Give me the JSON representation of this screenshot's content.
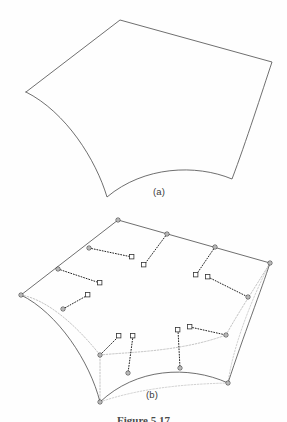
{
  "figure": {
    "panels": [
      {
        "id": "a",
        "label": "(a)"
      },
      {
        "id": "b",
        "label": "(b)"
      }
    ],
    "caption": "Figure 5.17",
    "colors": {
      "background": "#fefefe",
      "outline": "#555555",
      "control_polygon": "#9a9a9a",
      "marker_stroke": "#333333",
      "dotted_connector": "#222222",
      "label_text": "#3a3a3a"
    }
  },
  "panel_a": {
    "description": "Smooth curved quadrilateral surface patch outline",
    "corners": [
      {
        "name": "top",
        "x": 120,
        "y": 20
      },
      {
        "name": "right",
        "x": 272,
        "y": 62
      },
      {
        "name": "bottom-right",
        "x": 232,
        "y": 179
      },
      {
        "name": "bottom-left",
        "x": 107,
        "y": 197
      },
      {
        "name": "left",
        "x": 26,
        "y": 92
      }
    ],
    "edges": [
      {
        "from": "left",
        "to": "top",
        "curvature": "straight"
      },
      {
        "from": "top",
        "to": "right",
        "curvature": "straight"
      },
      {
        "from": "right",
        "to": "bottom-right",
        "curvature": "concave"
      },
      {
        "from": "bottom-right",
        "to": "bottom-left",
        "curvature": "concave"
      },
      {
        "from": "bottom-left",
        "to": "left",
        "curvature": "concave"
      }
    ]
  },
  "panel_b": {
    "description": "Same patch with boundary control points (circles), offset vectors (dotted) and square cross-boundary control points",
    "corners": [
      {
        "name": "top",
        "x": 118,
        "y": 220
      },
      {
        "name": "right",
        "x": 270,
        "y": 263
      },
      {
        "name": "bottom-right",
        "x": 228,
        "y": 383
      },
      {
        "name": "bottom-left",
        "x": 100,
        "y": 402
      },
      {
        "name": "left",
        "x": 21,
        "y": 295
      }
    ],
    "boundary_nodes": [
      {
        "x": 118,
        "y": 220
      },
      {
        "x": 89,
        "y": 248
      },
      {
        "x": 58,
        "y": 269
      },
      {
        "x": 21,
        "y": 295
      },
      {
        "x": 63,
        "y": 309
      },
      {
        "x": 100,
        "y": 355
      },
      {
        "x": 100,
        "y": 402
      },
      {
        "x": 128,
        "y": 373
      },
      {
        "x": 180,
        "y": 368
      },
      {
        "x": 228,
        "y": 383
      },
      {
        "x": 226,
        "y": 335
      },
      {
        "x": 248,
        "y": 297
      },
      {
        "x": 270,
        "y": 263
      },
      {
        "x": 215,
        "y": 247
      },
      {
        "x": 167,
        "y": 234
      }
    ],
    "square_control_points": [
      {
        "x": 132,
        "y": 257
      },
      {
        "x": 144,
        "y": 265
      },
      {
        "x": 100,
        "y": 283
      },
      {
        "x": 88,
        "y": 295
      },
      {
        "x": 196,
        "y": 275
      },
      {
        "x": 208,
        "y": 277
      },
      {
        "x": 119,
        "y": 336
      },
      {
        "x": 133,
        "y": 336
      },
      {
        "x": 178,
        "y": 330
      },
      {
        "x": 190,
        "y": 327
      }
    ],
    "marker_legend": {
      "circle": "boundary-control-point",
      "square": "cross-boundary-control-point",
      "dotted_line": "tangent-offset-vector",
      "gray_dashed": "control-polygon"
    }
  }
}
